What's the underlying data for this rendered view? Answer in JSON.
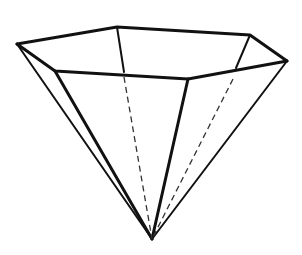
{
  "figure": {
    "stroke_color": "#111111",
    "background": "#ffffff",
    "vertices": {
      "apex": [
        152,
        239
      ],
      "left": [
        17,
        44
      ],
      "back_left": [
        117,
        27
      ],
      "back_right": [
        250,
        35
      ],
      "right": [
        287,
        61
      ],
      "front_right": [
        188,
        79
      ],
      "front_left": [
        55,
        71
      ]
    },
    "visible_edges": [
      [
        "left",
        "back_left"
      ],
      [
        "back_left",
        "back_right"
      ],
      [
        "back_right",
        "right"
      ],
      [
        "right",
        "front_right"
      ],
      [
        "front_right",
        "front_left"
      ],
      [
        "front_left",
        "left"
      ],
      [
        "left",
        "apex"
      ],
      [
        "front_left",
        "apex"
      ],
      [
        "front_right",
        "apex"
      ],
      [
        "right",
        "apex"
      ]
    ],
    "partial_edges": [
      [
        "back_left",
        "back_left_hidden_start"
      ],
      [
        "back_right",
        "back_right_hidden_start"
      ]
    ],
    "hidden_edges": [
      [
        "back_left",
        "apex"
      ],
      [
        "back_right",
        "apex"
      ]
    ]
  }
}
